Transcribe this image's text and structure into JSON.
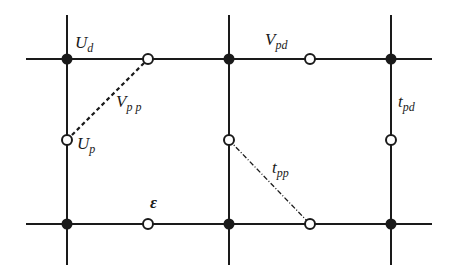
{
  "diagram": {
    "type": "lattice",
    "colors": {
      "line": "#1a1a1a",
      "background": "#ffffff"
    },
    "labels": {
      "Ud": {
        "main": "U",
        "sub": "d"
      },
      "Up": {
        "main": "U",
        "sub": "p"
      },
      "Vpp": {
        "main": "V",
        "sub": "p p"
      },
      "Vpd": {
        "main": "V",
        "sub": "pd"
      },
      "tpd": {
        "main": "t",
        "sub": "pd"
      },
      "tpp": {
        "main": "t",
        "sub": "pp"
      },
      "eps": {
        "main": "ε"
      }
    },
    "nodes": {
      "d_sites": [
        [
          67,
          59
        ],
        [
          229,
          59
        ],
        [
          391,
          59
        ],
        [
          67,
          224
        ],
        [
          229,
          224
        ],
        [
          391,
          224
        ]
      ],
      "p_sites": [
        [
          148,
          59
        ],
        [
          310,
          59
        ],
        [
          67,
          140
        ],
        [
          229,
          140
        ],
        [
          391,
          140
        ],
        [
          148,
          224
        ],
        [
          310,
          224
        ]
      ]
    },
    "bonds": {
      "Vpp": {
        "from": [
          67,
          140
        ],
        "to": [
          148,
          59
        ],
        "style": "dashed"
      },
      "tpp": {
        "from": [
          229,
          140
        ],
        "to": [
          310,
          224
        ],
        "style": "dash-dot"
      }
    }
  }
}
